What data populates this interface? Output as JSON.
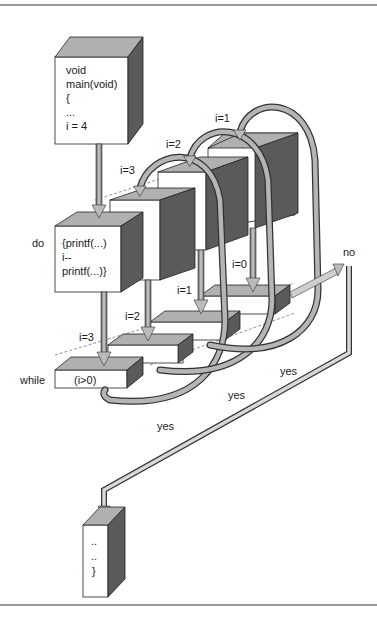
{
  "diagram": {
    "type": "do-while loop flow (3D)",
    "init_block": {
      "lines": [
        "void",
        "main(void)",
        "{",
        "...",
        "i = 4"
      ]
    },
    "do_block": {
      "keyword": "do",
      "lines": [
        "{printf(...)",
        "i--",
        "printf(...)}"
      ]
    },
    "while_block": {
      "keyword": "while",
      "condition": "(i>0)"
    },
    "iteration_labels_top": [
      "i=3",
      "i=2",
      "i=1"
    ],
    "iteration_labels_cond": [
      "i=3",
      "i=2",
      "i=1",
      "i=0"
    ],
    "yes_labels": [
      "yes",
      "yes",
      "yes"
    ],
    "no_label": "no",
    "end_block": {
      "lines": [
        "..",
        "..",
        "}"
      ]
    },
    "colors": {
      "box_front": "#ffffff",
      "box_top": "#b0b0b0",
      "box_side": "#5a5a5a",
      "arrow_dark": "#6e6e6e",
      "arrow_light": "#d8d8d8",
      "rule": "#777777"
    }
  }
}
